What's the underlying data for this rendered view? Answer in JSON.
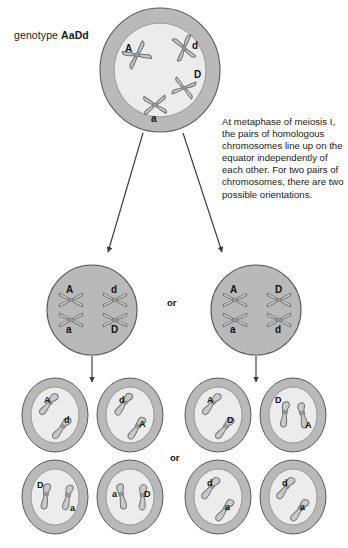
{
  "diagram": {
    "title_label": {
      "prefix": "genotype ",
      "genotype": "AaDd"
    },
    "note_text": "At metaphase of meiosis I, the pairs of homologous chromosomes line up on the equator independently of each other. For two pairs of chromosomes, there are two possible orientations.",
    "or_labels": {
      "metaphase_or": "or",
      "gamete_or": "or"
    },
    "colors": {
      "cell_membrane": "#b9b9b9",
      "nucleus": "#ececec",
      "metaphase_fill": "#b9b9b9",
      "chromosome_fill": "#c9c9c9",
      "chromosome_stroke": "#6e6e6e",
      "outline": "#5a5a5a",
      "arrow": "#3a3a3a",
      "text": "#1a1a1a"
    },
    "parent_cell": {
      "name": "parent-cell",
      "chromosome_labels": [
        "A",
        "d",
        "D",
        "a"
      ]
    },
    "metaphase_cells": [
      {
        "name": "metaphase-cell-left",
        "left_pair": {
          "top": "A",
          "bottom": "a"
        },
        "right_pair": {
          "top": "d",
          "bottom": "D"
        }
      },
      {
        "name": "metaphase-cell-right",
        "left_pair": {
          "top": "A",
          "bottom": "a"
        },
        "right_pair": {
          "top": "D",
          "bottom": "d"
        }
      }
    ],
    "gamete_groups": [
      {
        "name": "gamete-group-left",
        "cells": [
          {
            "name": "gamete-cell-1",
            "labels": [
              "A",
              "d"
            ]
          },
          {
            "name": "gamete-cell-2",
            "labels": [
              "d",
              "A"
            ]
          },
          {
            "name": "gamete-cell-3",
            "labels": [
              "D",
              "a"
            ]
          },
          {
            "name": "gamete-cell-4",
            "labels": [
              "a",
              "D"
            ]
          }
        ]
      },
      {
        "name": "gamete-group-right",
        "cells": [
          {
            "name": "gamete-cell-5",
            "labels": [
              "A",
              "D"
            ]
          },
          {
            "name": "gamete-cell-6",
            "labels": [
              "D",
              "A"
            ]
          },
          {
            "name": "gamete-cell-7",
            "labels": [
              "d",
              "a"
            ]
          },
          {
            "name": "gamete-cell-8",
            "labels": [
              "d",
              "a"
            ]
          }
        ]
      }
    ]
  }
}
